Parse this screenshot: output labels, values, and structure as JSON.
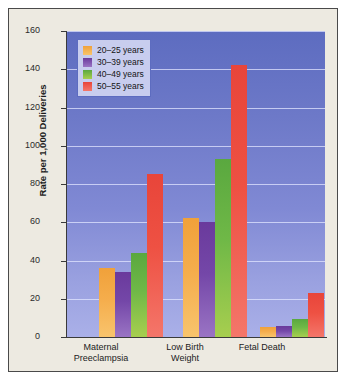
{
  "chart_data": {
    "type": "bar",
    "title": "",
    "xlabel": "",
    "ylabel": "Rate per 1,000 Deliveries",
    "ylim": [
      0,
      160
    ],
    "ytick_step": 20,
    "yticks": [
      "0",
      "20",
      "40",
      "60",
      "80",
      "100",
      "120",
      "140",
      "160"
    ],
    "grid": true,
    "legend_position": "top-left",
    "categories": [
      "Maternal Preeclampsia",
      "Low Birth Weight",
      "Fetal Death"
    ],
    "category_lines": [
      [
        "Maternal",
        "Preeclampsia"
      ],
      [
        "Low Birth",
        "Weight"
      ],
      [
        "Fetal Death",
        ""
      ]
    ],
    "series": [
      {
        "name": "20–25 years",
        "color": "#f0a13a",
        "values": [
          36,
          62,
          5
        ]
      },
      {
        "name": "30–39 years",
        "color": "#6a3a9c",
        "values": [
          34,
          60,
          5.5
        ]
      },
      {
        "name": "40–49 years",
        "color": "#5aa83f",
        "values": [
          44,
          93,
          9.5
        ]
      },
      {
        "name": "50–55 years",
        "color": "#e8453a",
        "values": [
          85,
          142,
          23
        ]
      }
    ]
  },
  "figure": {
    "background_color": "#edeae1",
    "border_color": "#4a4a4a",
    "plot_background_top": "#5d6cc0",
    "plot_background_bottom": "#aab0e8",
    "gridline_color": "#e1e6ff"
  }
}
